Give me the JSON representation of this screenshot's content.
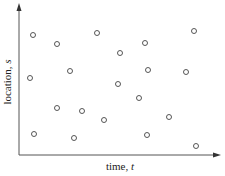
{
  "chart_data": {
    "type": "scatter",
    "title": "",
    "xlabel": "time, t",
    "ylabel": "location, s",
    "xlabel_parts": {
      "text": "time, ",
      "var": "t"
    },
    "ylabel_parts": {
      "text": "location, ",
      "var": "s"
    },
    "xlim": [
      0,
      200
    ],
    "ylim": [
      0,
      150
    ],
    "grid": false,
    "legend": null,
    "ticks": "none",
    "marker": "open-circle",
    "colors": {
      "axis": "#555555",
      "marker": "#444444",
      "text": "#222222"
    },
    "series": [
      {
        "name": "observations",
        "points": [
          {
            "x": 14,
            "y": 120
          },
          {
            "x": 38,
            "y": 111
          },
          {
            "x": 78,
            "y": 122
          },
          {
            "x": 126,
            "y": 112
          },
          {
            "x": 175,
            "y": 124
          },
          {
            "x": 101,
            "y": 102
          },
          {
            "x": 11,
            "y": 77
          },
          {
            "x": 51,
            "y": 84
          },
          {
            "x": 129,
            "y": 85
          },
          {
            "x": 167,
            "y": 83
          },
          {
            "x": 99,
            "y": 71
          },
          {
            "x": 120,
            "y": 57
          },
          {
            "x": 38,
            "y": 47
          },
          {
            "x": 63,
            "y": 44
          },
          {
            "x": 85,
            "y": 35
          },
          {
            "x": 150,
            "y": 38
          },
          {
            "x": 15,
            "y": 21
          },
          {
            "x": 55,
            "y": 17
          },
          {
            "x": 128,
            "y": 20
          },
          {
            "x": 177,
            "y": 9
          }
        ]
      }
    ]
  },
  "plot_area": {
    "left": 19,
    "top": 5,
    "right": 219,
    "bottom": 155
  }
}
